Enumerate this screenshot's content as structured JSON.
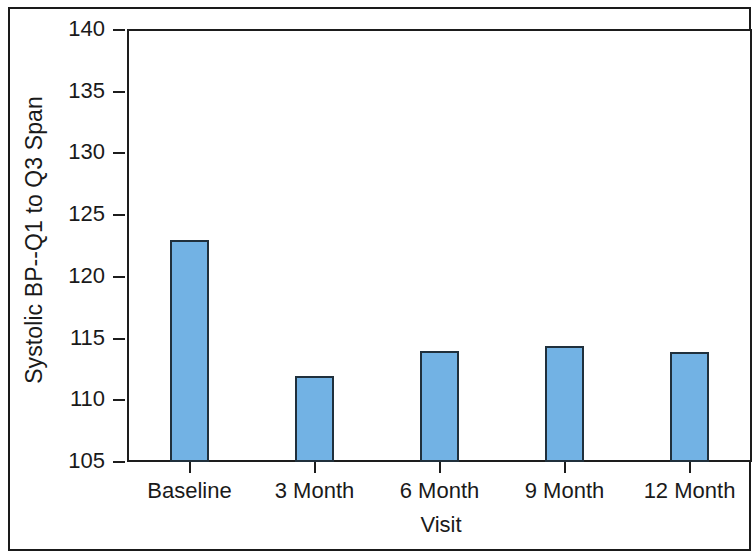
{
  "chart_data": {
    "type": "bar",
    "title": "",
    "subtitle": "",
    "xlabel": "Visit",
    "ylabel": "Systolic BP--Q1 to Q3 Span",
    "categories": [
      "Baseline",
      "3 Month",
      "6 Month",
      "9 Month",
      "12 Month"
    ],
    "values": [
      123.0,
      112.0,
      114.0,
      114.4,
      113.9
    ],
    "ylim": [
      105,
      140
    ],
    "yticks": [
      105,
      110,
      115,
      120,
      125,
      130,
      135,
      140
    ],
    "ytick_labels": [
      "105",
      "110",
      "115",
      "120",
      "125",
      "130",
      "135",
      "140"
    ],
    "grid": false,
    "legend": null,
    "bar_fill_color": "#72b2e4",
    "bar_edge_color": "#20303c",
    "axis_color": "#1d1d1d",
    "background_color": "#ffffff",
    "series": [
      {
        "name": "Systolic BP Q1 to Q3 Span",
        "values": [
          123.0,
          112.0,
          114.0,
          114.4,
          113.9
        ]
      }
    ],
    "annotations": []
  },
  "figure": {
    "frame_visible": true
  }
}
